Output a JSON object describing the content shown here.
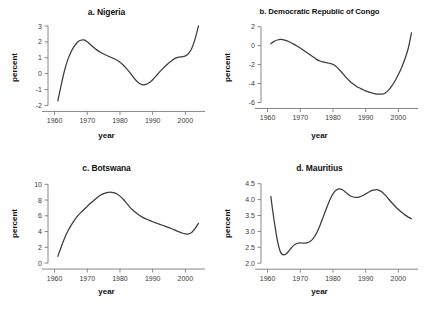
{
  "figure": {
    "background": "#ffffff",
    "curve_color": "#3b3b3b",
    "axis_color": "#7a7a7a"
  },
  "panels": [
    {
      "key": "a",
      "title": "a. Nigeria",
      "xlabel": "year",
      "ylabel": "percent"
    },
    {
      "key": "b",
      "title": "b. Democratic Republic of Congo",
      "xlabel": "year",
      "ylabel": "percent"
    },
    {
      "key": "c",
      "title": "c. Botswana",
      "xlabel": "year",
      "ylabel": "percent"
    },
    {
      "key": "d",
      "title": "d. Mauritius",
      "xlabel": "year",
      "ylabel": "percent"
    }
  ],
  "chart_data": [
    {
      "type": "line",
      "title": "a. Nigeria",
      "xlabel": "year",
      "ylabel": "percent",
      "xlim": [
        1958,
        2006
      ],
      "ylim": [
        -2.35,
        3.25
      ],
      "xticks": [
        1960,
        1970,
        1980,
        1990,
        2000
      ],
      "xtick_labels": [
        "1960",
        "1970",
        "1980",
        "1990",
        "2000"
      ],
      "yticks": [
        -2,
        -1,
        0,
        1,
        2,
        3
      ],
      "ytick_labels": [
        "-2",
        "-1",
        "0",
        "1",
        "2",
        "3"
      ],
      "grid": false,
      "legend": null,
      "x": [
        1961,
        1962,
        1963,
        1964,
        1965,
        1966,
        1967,
        1968,
        1969,
        1970,
        1971,
        1972,
        1973,
        1974,
        1975,
        1976,
        1977,
        1978,
        1979,
        1980,
        1981,
        1982,
        1983,
        1984,
        1985,
        1986,
        1987,
        1988,
        1989,
        1990,
        1991,
        1992,
        1993,
        1994,
        1995,
        1996,
        1997,
        1998,
        1999,
        2000,
        2001,
        2002,
        2003,
        2004
      ],
      "values": [
        -1.72,
        -0.75,
        0.15,
        0.85,
        1.35,
        1.72,
        1.98,
        2.1,
        2.12,
        2.0,
        1.82,
        1.64,
        1.48,
        1.35,
        1.24,
        1.14,
        1.05,
        0.96,
        0.86,
        0.72,
        0.54,
        0.32,
        0.08,
        -0.2,
        -0.45,
        -0.62,
        -0.7,
        -0.68,
        -0.56,
        -0.38,
        -0.16,
        0.08,
        0.3,
        0.5,
        0.68,
        0.85,
        0.98,
        1.04,
        1.06,
        1.12,
        1.28,
        1.62,
        2.2,
        3.0
      ]
    },
    {
      "type": "line",
      "title": "b. Democratic Republic of Congo",
      "xlabel": "year",
      "ylabel": "percent",
      "xlim": [
        1958,
        2006
      ],
      "ylim": [
        -6.9,
        2.5
      ],
      "xticks": [
        1960,
        1970,
        1980,
        1990,
        2000
      ],
      "xtick_labels": [
        "1960",
        "1970",
        "1980",
        "1990",
        "2000"
      ],
      "yticks": [
        -6,
        -4,
        -2,
        0,
        2
      ],
      "ytick_labels": [
        "-6",
        "-4",
        "-2",
        "0",
        "2"
      ],
      "grid": false,
      "legend": null,
      "x": [
        1961,
        1962,
        1963,
        1964,
        1965,
        1966,
        1967,
        1968,
        1969,
        1970,
        1971,
        1972,
        1973,
        1974,
        1975,
        1976,
        1977,
        1978,
        1979,
        1980,
        1981,
        1982,
        1983,
        1984,
        1985,
        1986,
        1987,
        1988,
        1989,
        1990,
        1991,
        1992,
        1993,
        1994,
        1995,
        1996,
        1997,
        1998,
        1999,
        2000,
        2001,
        2002,
        2003,
        2004
      ],
      "values": [
        0.2,
        0.45,
        0.6,
        0.66,
        0.62,
        0.5,
        0.34,
        0.16,
        -0.04,
        -0.25,
        -0.48,
        -0.72,
        -0.95,
        -1.2,
        -1.45,
        -1.62,
        -1.72,
        -1.8,
        -1.88,
        -1.98,
        -2.2,
        -2.55,
        -2.95,
        -3.35,
        -3.7,
        -4.0,
        -4.25,
        -4.45,
        -4.62,
        -4.78,
        -4.9,
        -5.0,
        -5.08,
        -5.12,
        -5.12,
        -5.0,
        -4.7,
        -4.25,
        -3.7,
        -3.05,
        -2.3,
        -1.4,
        -0.3,
        1.35
      ]
    },
    {
      "type": "line",
      "title": "c. Botswana",
      "xlabel": "year",
      "ylabel": "percent",
      "xlim": [
        1958,
        2006
      ],
      "ylim": [
        -0.5,
        10.8
      ],
      "xticks": [
        1960,
        1970,
        1980,
        1990,
        2000
      ],
      "xtick_labels": [
        "1960",
        "1970",
        "1980",
        "1990",
        "2000"
      ],
      "yticks": [
        0,
        2,
        4,
        6,
        8,
        10
      ],
      "ytick_labels": [
        "0",
        "2",
        "4",
        "6",
        "8",
        "10"
      ],
      "grid": false,
      "legend": null,
      "x": [
        1961,
        1962,
        1963,
        1964,
        1965,
        1966,
        1967,
        1968,
        1969,
        1970,
        1971,
        1972,
        1973,
        1974,
        1975,
        1976,
        1977,
        1978,
        1979,
        1980,
        1981,
        1982,
        1983,
        1984,
        1985,
        1986,
        1987,
        1988,
        1989,
        1990,
        1991,
        1992,
        1993,
        1994,
        1995,
        1996,
        1997,
        1998,
        1999,
        2000,
        2001,
        2002,
        2003,
        2004
      ],
      "values": [
        0.85,
        2.0,
        3.1,
        4.0,
        4.75,
        5.4,
        5.95,
        6.4,
        6.8,
        7.2,
        7.6,
        7.95,
        8.3,
        8.6,
        8.82,
        8.95,
        9.0,
        8.95,
        8.8,
        8.5,
        8.1,
        7.6,
        7.1,
        6.7,
        6.35,
        6.05,
        5.8,
        5.6,
        5.42,
        5.25,
        5.1,
        4.95,
        4.8,
        4.65,
        4.5,
        4.32,
        4.15,
        3.98,
        3.82,
        3.72,
        3.7,
        3.9,
        4.4,
        5.05
      ]
    },
    {
      "type": "line",
      "title": "d. Mauritius",
      "xlabel": "year",
      "ylabel": "percent",
      "xlim": [
        1958,
        2006
      ],
      "ylim": [
        1.88,
        4.68
      ],
      "xticks": [
        1960,
        1970,
        1980,
        1990,
        2000
      ],
      "xtick_labels": [
        "1960",
        "1970",
        "1980",
        "1990",
        "2000"
      ],
      "yticks": [
        2.0,
        2.5,
        3.0,
        3.5,
        4.0,
        4.5
      ],
      "ytick_labels": [
        "2.0",
        "2.5",
        "3.0",
        "3.5",
        "4.0",
        "4.5"
      ],
      "grid": false,
      "legend": null,
      "x": [
        1961,
        1962,
        1963,
        1964,
        1965,
        1966,
        1967,
        1968,
        1969,
        1970,
        1971,
        1972,
        1973,
        1974,
        1975,
        1976,
        1977,
        1978,
        1979,
        1980,
        1981,
        1982,
        1983,
        1984,
        1985,
        1986,
        1987,
        1988,
        1989,
        1990,
        1991,
        1992,
        1993,
        1994,
        1995,
        1996,
        1997,
        1998,
        1999,
        2000,
        2001,
        2002,
        2003,
        2004
      ],
      "values": [
        4.1,
        3.35,
        2.72,
        2.34,
        2.26,
        2.32,
        2.45,
        2.56,
        2.62,
        2.64,
        2.63,
        2.64,
        2.68,
        2.78,
        2.95,
        3.18,
        3.45,
        3.72,
        3.98,
        4.18,
        4.3,
        4.34,
        4.3,
        4.22,
        4.14,
        4.09,
        4.07,
        4.08,
        4.12,
        4.18,
        4.24,
        4.29,
        4.31,
        4.3,
        4.24,
        4.14,
        4.02,
        3.9,
        3.79,
        3.69,
        3.6,
        3.52,
        3.45,
        3.4
      ]
    }
  ]
}
